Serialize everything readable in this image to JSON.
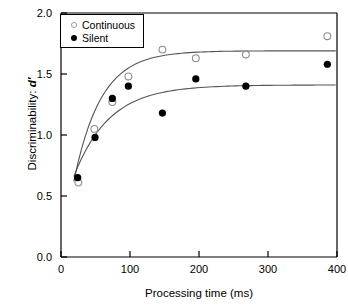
{
  "chart_data": {
    "type": "scatter",
    "title": "",
    "xlabel": "Processing time (ms)",
    "ylabel": "Discriminability: d′",
    "xlim": [
      0,
      430
    ],
    "ylim": [
      0.0,
      2.0
    ],
    "grid": false,
    "legend_position": "top-left",
    "xticks": [
      "0",
      "100",
      "200",
      "300",
      "400"
    ],
    "xtick_values": [
      0,
      100,
      200,
      300,
      400
    ],
    "yticks": [
      "0.0",
      "0.5",
      "1.0",
      "1.5",
      "2.0"
    ],
    "ytick_values": [
      0.0,
      0.5,
      1.0,
      1.5,
      2.0
    ],
    "series": [
      {
        "name": "Continuous",
        "marker": "open-circle",
        "color": "#8c8c8c",
        "x": [
          27,
          52,
          80,
          105,
          158,
          210,
          288,
          415
        ],
        "values": [
          0.61,
          1.05,
          1.27,
          1.48,
          1.7,
          1.63,
          1.66,
          1.81
        ],
        "fit_asymptote": 1.69
      },
      {
        "name": "Silent",
        "marker": "filled-circle",
        "color": "#000000",
        "x": [
          26,
          53,
          80,
          105,
          158,
          210,
          288,
          415
        ],
        "values": [
          0.65,
          0.98,
          1.3,
          1.4,
          1.18,
          1.46,
          1.4,
          1.58
        ],
        "fit_asymptote": 1.41
      }
    ]
  },
  "axes": {
    "ylabel_prefix": "Discriminability: ",
    "ylabel_symbol": "d′",
    "xlabel": "Processing time (ms)"
  },
  "legend": {
    "items": [
      {
        "label": "Continuous",
        "marker": "open-circle"
      },
      {
        "label": "Silent",
        "marker": "filled-circle"
      }
    ]
  }
}
